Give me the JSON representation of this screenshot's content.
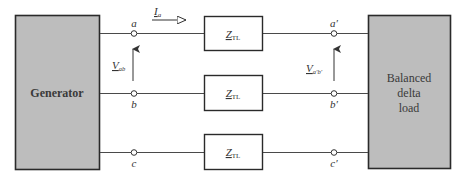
{
  "diagram": {
    "type": "three-phase circuit block diagram",
    "generator": {
      "label": "Generator"
    },
    "load": {
      "label_lines": [
        "Balanced",
        "delta",
        "load"
      ]
    },
    "lines": [
      {
        "phase": "a",
        "source_node": "a",
        "load_node": "a′",
        "impedance_main": "Z",
        "impedance_sub": "TL"
      },
      {
        "phase": "b",
        "source_node": "b",
        "load_node": "b′",
        "impedance_main": "Z",
        "impedance_sub": "TL"
      },
      {
        "phase": "c",
        "source_node": "c",
        "load_node": "c′",
        "impedance_main": "Z",
        "impedance_sub": "TL"
      }
    ],
    "current": {
      "main": "I",
      "sub": "a"
    },
    "source_voltage": {
      "main": "V",
      "sub": "ab"
    },
    "load_voltage": {
      "main": "V",
      "sub": "a′b′"
    },
    "colors": {
      "block_fill": "#bdbdbd",
      "block_stroke": "#2a2a2a",
      "wire": "#4a4a4a",
      "text": "#333333"
    }
  }
}
